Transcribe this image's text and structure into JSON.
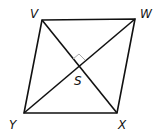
{
  "diagram": {
    "type": "rhombus-with-diagonals",
    "vertices": [
      {
        "name": "V",
        "x": 42,
        "y": 20
      },
      {
        "name": "W",
        "x": 135,
        "y": 19
      },
      {
        "name": "X",
        "x": 117,
        "y": 113
      },
      {
        "name": "Y",
        "x": 24,
        "y": 113
      }
    ],
    "intersection": {
      "name": "S",
      "x": 79,
      "y": 67
    },
    "labels": {
      "V": "V",
      "W": "W",
      "X": "X",
      "Y": "Y",
      "S": "S"
    },
    "right_angle_marker": true,
    "stroke_color": "#111111"
  }
}
